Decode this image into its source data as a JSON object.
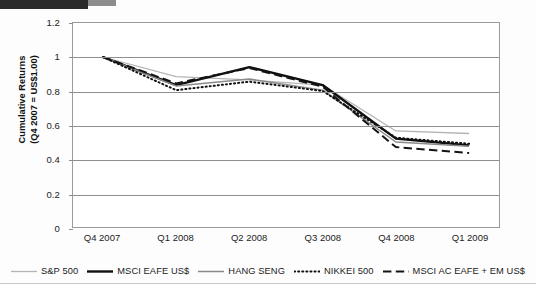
{
  "chart_data": {
    "type": "line",
    "title": "",
    "xlabel": "",
    "ylabel": "Cumulative Returns\n(Q4 2007 = US$1.00)",
    "categories": [
      "Q4 2007",
      "Q1 2008",
      "Q2 2008",
      "Q3 2008",
      "Q4 2008",
      "Q1 2009"
    ],
    "ylim": [
      0,
      1.2
    ],
    "ytick_labels": [
      "1.2",
      "1",
      "0.8",
      "0.6",
      "0.4",
      "0.2",
      "0"
    ],
    "ytick_values": [
      1.2,
      1,
      0.8,
      0.6,
      0.4,
      0.2,
      0
    ],
    "grid": true,
    "legend_position": "bottom",
    "series": [
      {
        "name": "S&P 500",
        "style": "solid-light",
        "color": "#b4b4b4",
        "width": 1.3,
        "values": [
          1.0,
          0.885,
          0.865,
          0.835,
          0.565,
          0.55
        ]
      },
      {
        "name": "MSCI EAFE US$",
        "style": "solid-bold",
        "color": "#0f0f0f",
        "width": 2.4,
        "values": [
          1.0,
          0.835,
          0.94,
          0.835,
          0.52,
          0.48
        ]
      },
      {
        "name": "HANG SENG",
        "style": "solid",
        "color": "#8a8a8a",
        "width": 1.5,
        "values": [
          1.0,
          0.83,
          0.87,
          0.805,
          0.5,
          0.475
        ]
      },
      {
        "name": "NIKKEI 500",
        "style": "dotted",
        "color": "#111111",
        "width": 2.0,
        "values": [
          1.0,
          0.805,
          0.855,
          0.8,
          0.525,
          0.49
        ]
      },
      {
        "name": "MSCI AC EAFE + EM US$",
        "style": "dashed",
        "color": "#141414",
        "width": 2.0,
        "values": [
          1.0,
          0.845,
          0.935,
          0.825,
          0.47,
          0.435
        ]
      }
    ]
  }
}
